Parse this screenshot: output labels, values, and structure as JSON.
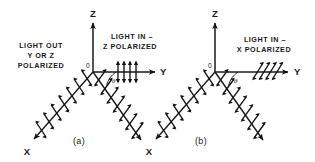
{
  "figure": {
    "background_color": "#ffffff",
    "ink_color": "#1a1a1a",
    "width": 315,
    "height": 162
  },
  "panels": [
    {
      "id": "a",
      "panel_label": "(a)",
      "origin_label": "0",
      "angle_label": "θ",
      "axes": [
        {
          "name": "z-axis",
          "label": "Z"
        },
        {
          "name": "y-axis",
          "label": "Y"
        },
        {
          "name": "x-axis",
          "label": "X"
        }
      ],
      "annotations": [
        {
          "name": "light-out-label",
          "lines": [
            "LIGHT OUT",
            "Y OR Z",
            "POLARIZED"
          ]
        },
        {
          "name": "light-in-label",
          "lines": [
            "LIGHT IN –",
            "Z POLARIZED"
          ]
        }
      ],
      "incoming_beam": {
        "name": "incoming-beam-z-polarized",
        "polarization": "Z",
        "arrow_style": "vertical-double-headed",
        "arrow_count": 4
      },
      "scattered_rays": [
        {
          "name": "scattered-ray-left",
          "direction": "toward-X",
          "arrow_style": "perpendicular-double-headed",
          "arrow_count": 7
        },
        {
          "name": "scattered-ray-right",
          "direction": "lower-right",
          "arrow_style": "perpendicular-double-headed",
          "arrow_count": 7
        }
      ]
    },
    {
      "id": "b",
      "panel_label": "(b)",
      "origin_label": "0",
      "angle_label": "θ",
      "axes": [
        {
          "name": "z-axis",
          "label": "Z"
        },
        {
          "name": "y-axis",
          "label": "Y"
        },
        {
          "name": "x-axis",
          "label": "X"
        }
      ],
      "annotations": [
        {
          "name": "light-in-label",
          "lines": [
            "LIGHT IN –",
            "X POLARIZED"
          ]
        }
      ],
      "incoming_beam": {
        "name": "incoming-beam-x-polarized",
        "polarization": "X",
        "arrow_style": "slanted-double-headed",
        "arrow_count": 4
      },
      "scattered_rays": [
        {
          "name": "scattered-ray-left",
          "direction": "toward-X",
          "arrow_style": "perpendicular-double-headed",
          "arrow_count": 7
        },
        {
          "name": "scattered-ray-right",
          "direction": "lower-right",
          "arrow_style": "perpendicular-double-headed",
          "arrow_count": 7
        }
      ]
    }
  ]
}
